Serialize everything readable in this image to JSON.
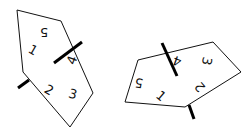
{
  "figure": {
    "shapes": [
      {
        "name": "left-pentagon",
        "points": "17,10 61,21 93,93 70,127 23,72",
        "marks": [
          {
            "x1": 54,
            "y1": 63,
            "x2": 82,
            "y2": 42
          },
          {
            "x1": 18,
            "y1": 88,
            "x2": 29,
            "y2": 80
          }
        ],
        "labels": [
          {
            "text": "5",
            "x": 44,
            "y": 32,
            "rot": 180
          },
          {
            "text": "1",
            "x": 33,
            "y": 50,
            "rot": 30
          },
          {
            "text": "4",
            "x": 72,
            "y": 60,
            "rot": -70
          },
          {
            "text": "2",
            "x": 49,
            "y": 90,
            "rot": 30
          },
          {
            "text": "3",
            "x": 73,
            "y": 94,
            "rot": 15
          }
        ]
      },
      {
        "name": "right-pentagon",
        "points": "138,60 213,42 241,72 185,107 125,102",
        "marks": [
          {
            "x1": 162,
            "y1": 43,
            "x2": 177,
            "y2": 76
          },
          {
            "x1": 189,
            "y1": 105,
            "x2": 194,
            "y2": 119
          }
        ],
        "labels": [
          {
            "text": "4",
            "x": 177,
            "y": 61,
            "rot": 200
          },
          {
            "text": "3",
            "x": 207,
            "y": 61,
            "rot": 100
          },
          {
            "text": "5",
            "x": 139,
            "y": 83,
            "rot": 190
          },
          {
            "text": "2",
            "x": 200,
            "y": 87,
            "rot": 230
          },
          {
            "text": "1",
            "x": 161,
            "y": 96,
            "rot": 40
          }
        ]
      }
    ]
  }
}
